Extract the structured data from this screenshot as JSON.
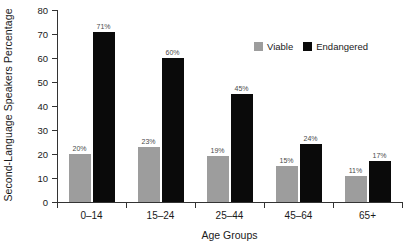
{
  "chart_data": {
    "type": "bar",
    "title": "",
    "xlabel": "Age Groups",
    "ylabel": "Second-Language Speakers Percentage",
    "categories": [
      "0–14",
      "15–24",
      "25–44",
      "45–64",
      "65+"
    ],
    "series": [
      {
        "name": "Viable",
        "color": "#9d9d9d",
        "values": [
          20,
          23,
          19,
          15,
          11
        ],
        "labels": [
          "20%",
          "23%",
          "19%",
          "15%",
          "11%"
        ]
      },
      {
        "name": "Endangered",
        "color": "#0a0a0a",
        "values": [
          71,
          60,
          45,
          24,
          17
        ],
        "labels": [
          "71%",
          "60%",
          "45%",
          "24%",
          "17%"
        ]
      }
    ],
    "ylim": [
      0,
      80
    ],
    "yticks": [
      0,
      10,
      20,
      30,
      40,
      50,
      60,
      70,
      80
    ],
    "ytick_labels": [
      "0",
      "10",
      "20",
      "30",
      "40",
      "50",
      "60",
      "70",
      "80"
    ],
    "grid": false,
    "legend_position": "top-right"
  }
}
